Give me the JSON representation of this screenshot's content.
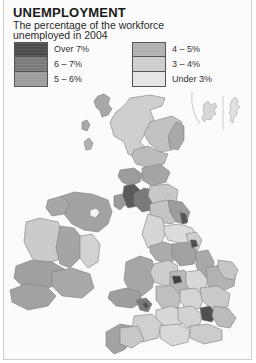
{
  "map": {
    "title": "UNEMPLOYMENT",
    "subtitle_line1": "The percentage of the workforce",
    "subtitle_line2": "unemployed in 2004",
    "legend": {
      "left": [
        {
          "label": "Over 7%",
          "color": "#4a4a4a"
        },
        {
          "label": "6 – 7%",
          "color": "#7a7a7a"
        },
        {
          "label": "5 – 6%",
          "color": "#9c9c9c"
        }
      ],
      "right": [
        {
          "label": "4 – 5%",
          "color": "#afafaf"
        },
        {
          "label": "3 – 4%",
          "color": "#cdcdcd"
        },
        {
          "label": "Under 3%",
          "color": "#e4e4e4"
        }
      ]
    },
    "regions": [
      "Scotland",
      "Northern Ireland",
      "Republic of Ireland",
      "England",
      "Wales",
      "Orkney",
      "Shetland"
    ],
    "colors": {
      "background": "#fbfbfb",
      "border": "#cfcfcf",
      "coastline": "#8a8a8a"
    }
  }
}
